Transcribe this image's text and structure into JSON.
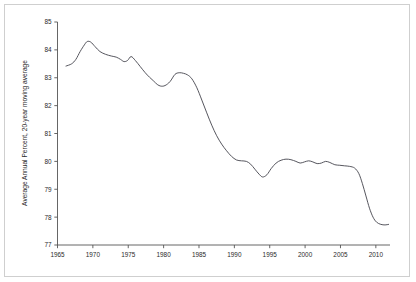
{
  "chart_data": {
    "type": "line",
    "title": "",
    "subtitle": "",
    "xlabel": "",
    "ylabel": "Average Annual Percent, 20-year moving average",
    "xlim": [
      1965,
      2012
    ],
    "ylim": [
      77,
      85
    ],
    "xticks": [
      1965,
      1970,
      1975,
      1980,
      1985,
      1990,
      1995,
      2000,
      2005,
      2010
    ],
    "xtick_labels": [
      "1965",
      "1970",
      "1975",
      "1980",
      "1985",
      "1990",
      "1995",
      "2000",
      "2005",
      "2010"
    ],
    "yticks": [
      77,
      78,
      79,
      80,
      81,
      82,
      83,
      84,
      85
    ],
    "ytick_labels": [
      "77",
      "78",
      "79",
      "80",
      "81",
      "82",
      "83",
      "84",
      "85"
    ],
    "grid": false,
    "legend": false,
    "legend_position": "none",
    "line_color": "#4d4d55",
    "series": [
      {
        "name": "20-year moving average",
        "x": [
          1966.2,
          1967.0,
          1967.6,
          1968.2,
          1968.8,
          1969.2,
          1969.7,
          1970.3,
          1971.0,
          1971.8,
          1972.6,
          1973.3,
          1973.9,
          1974.4,
          1974.9,
          1975.4,
          1976.0,
          1976.7,
          1977.4,
          1978.0,
          1978.6,
          1979.1,
          1979.6,
          1980.2,
          1980.9,
          1981.6,
          1982.2,
          1982.8,
          1983.4,
          1984.0,
          1984.7,
          1985.4,
          1986.1,
          1986.8,
          1987.5,
          1988.2,
          1988.9,
          1989.6,
          1990.3,
          1991.0,
          1991.7,
          1992.3,
          1992.9,
          1993.5,
          1994.0,
          1994.6,
          1995.2,
          1995.9,
          1996.6,
          1997.3,
          1998.0,
          1998.7,
          1999.3,
          1999.9,
          2000.5,
          2001.1,
          2001.7,
          2002.3,
          2002.9,
          2003.5,
          2004.2,
          2004.9,
          2005.6,
          2006.3,
          2007.0,
          2007.6,
          2008.1,
          2008.6,
          2009.1,
          2009.6,
          2010.1,
          2010.7,
          2011.3,
          2011.8
        ],
        "y": [
          83.42,
          83.5,
          83.66,
          83.94,
          84.18,
          84.3,
          84.28,
          84.12,
          83.94,
          83.84,
          83.78,
          83.74,
          83.66,
          83.58,
          83.62,
          83.76,
          83.62,
          83.4,
          83.18,
          83.02,
          82.88,
          82.76,
          82.7,
          82.72,
          82.86,
          83.12,
          83.18,
          83.16,
          83.1,
          82.96,
          82.64,
          82.2,
          81.74,
          81.3,
          80.92,
          80.62,
          80.38,
          80.18,
          80.05,
          80.02,
          80.0,
          79.9,
          79.72,
          79.54,
          79.44,
          79.52,
          79.74,
          79.94,
          80.04,
          80.08,
          80.06,
          80.0,
          79.94,
          79.98,
          80.02,
          79.98,
          79.92,
          79.94,
          80.0,
          79.96,
          79.88,
          79.86,
          79.84,
          79.82,
          79.76,
          79.56,
          79.2,
          78.76,
          78.32,
          78.0,
          77.82,
          77.74,
          77.72,
          77.74
        ]
      }
    ]
  },
  "axes": {
    "y_axis_title": "Average Annual Percent, 20-year moving average"
  }
}
